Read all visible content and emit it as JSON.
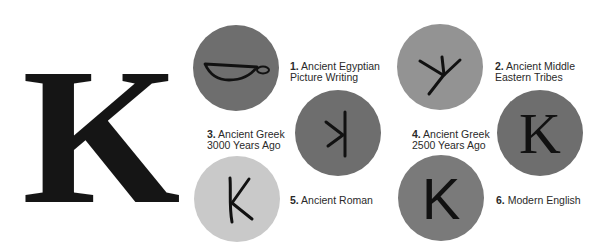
{
  "title_letter": "K",
  "colors": {
    "dark_circle": "#6e6e6e",
    "medium_circle": "#939393",
    "light_circle": "#c9c9c9",
    "glyph": "#111111",
    "text": "#2a2a2a"
  },
  "stages": [
    {
      "number": "1.",
      "line1": "Ancient Egyptian",
      "line2": "Picture Writing",
      "glyph_icon": "basket-hieroglyph-icon",
      "circle_shade": "dark"
    },
    {
      "number": "2.",
      "line1": "Ancient Middle",
      "line2": "Eastern Tribes",
      "glyph_icon": "hand-branch-glyph-icon",
      "circle_shade": "medium"
    },
    {
      "number": "3.",
      "line1": "Ancient Greek",
      "line2": "3000 Years Ago",
      "glyph_icon": "reversed-k-glyph-icon",
      "circle_shade": "dark"
    },
    {
      "number": "4.",
      "line1": "Ancient Greek",
      "line2": "2500 Years Ago",
      "glyph": "K",
      "glyph_icon": "serif-k-glyph-icon",
      "circle_shade": "dark"
    },
    {
      "number": "5.",
      "line1": "Ancient Roman",
      "line2": "",
      "glyph_icon": "handwritten-k-glyph-icon",
      "circle_shade": "light"
    },
    {
      "number": "6.",
      "line1": "Modern English",
      "line2": "",
      "glyph": "K",
      "glyph_icon": "sans-k-glyph-icon",
      "circle_shade": "medium"
    }
  ]
}
